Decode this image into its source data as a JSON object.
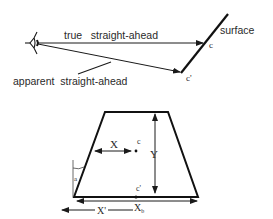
{
  "top_diagram": {
    "labels": {
      "true_straight_ahead": "true   straight-ahead",
      "apparent_straight_ahead": "apparent  straight-ahead",
      "surface": "surface",
      "point_c": "c",
      "point_c_prime": "c'"
    }
  },
  "bottom_diagram": {
    "labels": {
      "x": "X",
      "y": "Y",
      "c": "c",
      "c_prime": "c'",
      "x_prime": "X'",
      "x_b": "X",
      "x_b_subscript": "b",
      "angle": "a"
    }
  },
  "colors": {
    "stroke": "#1a1a1a",
    "text": "#2a2a2a",
    "background": "#ffffff"
  }
}
